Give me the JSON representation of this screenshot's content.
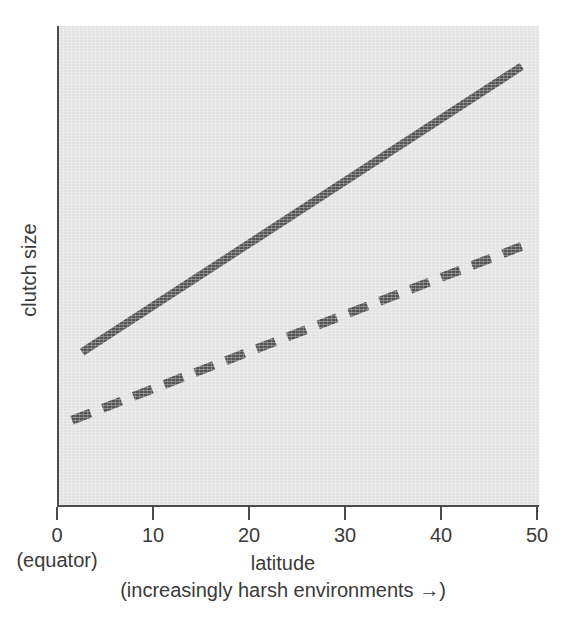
{
  "chart_data": {
    "type": "line",
    "title": "",
    "xlabel": "latitude",
    "xsublabel": "(increasingly harsh environments →)",
    "ylabel": "clutch size",
    "origin_note": "(equator)",
    "xlim": [
      0,
      50
    ],
    "ylim": [
      0,
      10
    ],
    "xticks": [
      0,
      10,
      20,
      30,
      40,
      50
    ],
    "xtick_labels": [
      "0",
      "10",
      "20",
      "30",
      "40",
      "50"
    ],
    "yticks": [],
    "ytick_labels": [],
    "grid": false,
    "legend": "none",
    "panel_color": "#e3e3e3",
    "axis_color": "#4a4a4a",
    "series": [
      {
        "name": "solid-trend",
        "style": "solid",
        "color": "#555555",
        "width_px": 8,
        "x": [
          2.4,
          48.2
        ],
        "y": [
          3.19,
          9.16
        ]
      },
      {
        "name": "dashed-trend",
        "style": "dashed",
        "color": "#555555",
        "width_px": 9,
        "dash_pattern": [
          20,
          13
        ],
        "x": [
          1.35,
          49.1
        ],
        "y": [
          1.77,
          5.47
        ]
      }
    ]
  },
  "figure": {
    "background": "#ffffff"
  }
}
